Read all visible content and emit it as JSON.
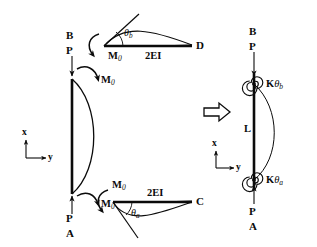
{
  "figure": {
    "transform_arrow": "⇒",
    "left_model": {
      "name": "column-with-end-moments",
      "top_point_label": "B",
      "top_load_label": "P",
      "top_moment_label": "M",
      "top_moment_sub": "0",
      "bottom_moment_label": "M",
      "bottom_moment_sub": "0",
      "bottom_load_label": "P",
      "bottom_point_label": "A",
      "axis_x": "x",
      "axis_y": "y"
    },
    "top_beam": {
      "name": "upper-beam-BD",
      "angle_label": "θ",
      "angle_sub": "b",
      "moment_label": "M",
      "moment_sub": "0",
      "stiffness_label": "2EI",
      "far_end_label": "D"
    },
    "bottom_beam": {
      "name": "lower-beam-AC",
      "angle_label": "θ",
      "angle_sub": "a",
      "moment_label": "M",
      "moment_sub": "0",
      "stiffness_label": "2EI",
      "far_end_label": "C"
    },
    "right_model": {
      "name": "equivalent-spring-column",
      "top_point_label": "B",
      "top_load_label": "P",
      "top_spring_label": "K",
      "top_spring_theta": "θ",
      "top_spring_sub": "b",
      "length_label": "L",
      "bottom_spring_label": "K",
      "bottom_spring_theta": "θ",
      "bottom_spring_sub": "a",
      "bottom_load_label": "P",
      "bottom_point_label": "A",
      "axis_x": "x",
      "axis_y": "y"
    },
    "colors": {
      "ink": "#0b0b0b",
      "background": "#ffffff"
    }
  }
}
